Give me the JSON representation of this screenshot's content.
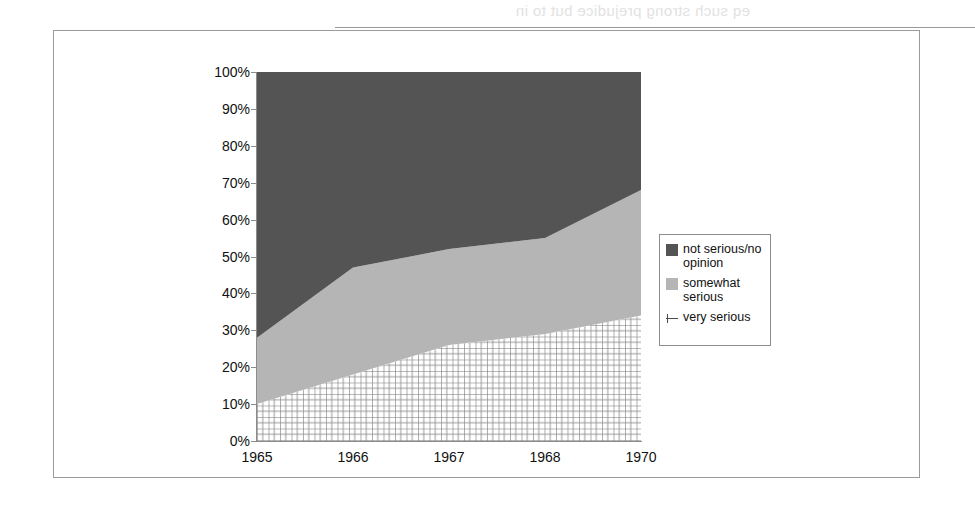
{
  "page": {
    "bleed_text": "eq such strong prejudice but to in",
    "bleed_side_text": "Milit\nTh\npol\nIntro"
  },
  "chart_data": {
    "type": "area",
    "stacked": true,
    "title": "",
    "subtitle": "",
    "xlabel": "",
    "ylabel": "",
    "categories": [
      "1965",
      "1966",
      "1967",
      "1968",
      "1970"
    ],
    "x_tick_labels": [
      "1965",
      "1966",
      "1967",
      "1968",
      "1970"
    ],
    "y_tick_labels": [
      "0%",
      "10%",
      "20%",
      "30%",
      "40%",
      "50%",
      "60%",
      "70%",
      "80%",
      "90%",
      "100%"
    ],
    "y_tick_values": [
      0,
      10,
      20,
      30,
      40,
      50,
      60,
      70,
      80,
      90,
      100
    ],
    "ylim": [
      0,
      100
    ],
    "y_unit": "%",
    "grid": false,
    "legend_position": "right",
    "series": [
      {
        "name": "very serious",
        "key_style": "crosshatch-grid",
        "color": "#ffffff",
        "pattern_color": "#6e6e6e",
        "values": [
          10,
          18,
          26,
          29,
          34
        ]
      },
      {
        "name": "somewhat serious",
        "key_style": "square",
        "color": "#b5b5b5",
        "values": [
          18,
          29,
          26,
          26,
          34
        ]
      },
      {
        "name": "not serious/no opinion",
        "key_style": "square",
        "color": "#545454",
        "values": [
          72,
          53,
          48,
          45,
          32
        ]
      }
    ],
    "cumulative_tops": {
      "very_serious": [
        10,
        18,
        26,
        29,
        34
      ],
      "somewhat_serious": [
        28,
        47,
        52,
        55,
        68
      ],
      "not_serious": [
        100,
        100,
        100,
        100,
        100
      ]
    }
  },
  "legend": {
    "entries": [
      {
        "label": "not serious/no opinion",
        "key": "dark-square-swatch"
      },
      {
        "label": "somewhat serious",
        "key": "light-square-swatch"
      },
      {
        "label": "very serious",
        "key": "grid-line-marker"
      }
    ]
  },
  "colors": {
    "not_serious": "#545454",
    "somewhat_serious": "#b5b5b5",
    "very_serious_pattern": "#6e6e6e",
    "axis": "#8c8c8c",
    "frame": "#9b9b9b",
    "text": "#111111"
  }
}
